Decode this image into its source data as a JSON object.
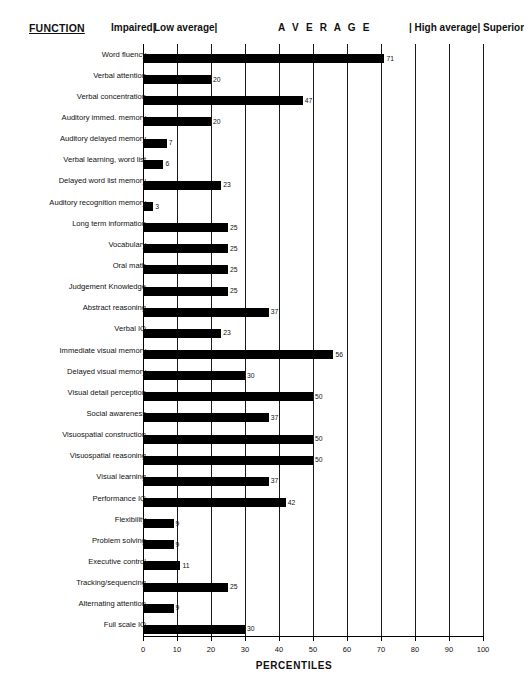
{
  "header": {
    "function_label": "FUNCTION",
    "zones": [
      {
        "name": "impaired",
        "label": "Impaired|",
        "left_px": 111
      },
      {
        "name": "low-average",
        "label": "Low average|",
        "left_px": 154
      },
      {
        "name": "average",
        "label": "A V E R A G E",
        "left_px": 278
      },
      {
        "name": "high-average",
        "label": "| High average|",
        "left_px": 409
      },
      {
        "name": "superior",
        "label": "Superior",
        "left_px": 483
      }
    ]
  },
  "chart_data": {
    "type": "bar",
    "orientation": "horizontal",
    "title": "",
    "xlabel": "PERCENTILES",
    "ylabel": "FUNCTION",
    "xlim": [
      0,
      100
    ],
    "xticks": [
      0,
      10,
      20,
      30,
      40,
      50,
      60,
      70,
      80,
      90,
      100
    ],
    "xtick_labels": [
      "0",
      "10",
      "20",
      "30",
      "40",
      "50",
      "60",
      "70",
      "80",
      "90",
      "100"
    ],
    "grid": true,
    "grid_axis": "x",
    "legend": false,
    "bar_color": "#000000",
    "zone_boundaries": [
      10,
      25,
      75,
      90
    ],
    "categories": [
      "Word fluency",
      "Verbal attention",
      "Verbal concentration",
      "Auditory immed. memory",
      "Auditory delayed memory",
      "Verbal learning, word list",
      "Delayed word list memory",
      "Auditory recognition memory",
      "Long term information",
      "Vocabulary",
      "Oral math",
      "Judgement Knowledge",
      "Abstract reasoning",
      "Verbal IQ",
      "Immediate visual memory",
      "Delayed visual memory",
      "Visual detail perception",
      "Social awareness",
      "Visuospatial construction",
      "Visuospatial reasoning",
      "Visual learning",
      "Performance IQ",
      "Flexibility",
      "Problem solving",
      "Executive control",
      "Tracking/sequencing",
      "Alternating attention",
      "Full scale IQ"
    ],
    "values": [
      71,
      20,
      47,
      20,
      7,
      6,
      23,
      3,
      25,
      25,
      25,
      25,
      37,
      23,
      56,
      30,
      50,
      37,
      50,
      50,
      37,
      42,
      9,
      9,
      11,
      25,
      9,
      30
    ],
    "value_labels": [
      "71",
      "20",
      "47",
      "20",
      "7",
      "6",
      "23",
      "3",
      "25",
      "25",
      "25",
      "25",
      "37",
      "23",
      "56",
      "30",
      "50",
      "37",
      "50",
      "50",
      "37",
      "42",
      "9",
      "9",
      "11",
      "25",
      "9",
      "30"
    ]
  }
}
